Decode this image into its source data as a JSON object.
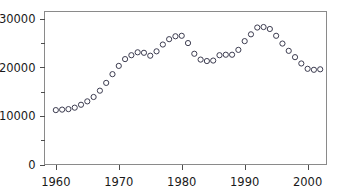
{
  "chart_data": {
    "type": "scatter",
    "title": "",
    "xlabel": "",
    "ylabel": "",
    "xlim": [
      1958.2,
      2003.0
    ],
    "ylim": [
      0,
      31500
    ],
    "grid": false,
    "legend": null,
    "marker": "open-circle",
    "marker_color": "#3c3c50",
    "y_ticks": [
      0,
      10000,
      20000,
      30000
    ],
    "y_tick_labels": [
      "0",
      "10000",
      "20000",
      "30000"
    ],
    "y_minor_ticks": [
      5000,
      15000,
      25000
    ],
    "x_ticks": [
      1960,
      1970,
      1980,
      1990,
      2000
    ],
    "x_tick_labels": [
      "1960",
      "1970",
      "1980",
      "1990",
      "2000"
    ],
    "x": [
      1960,
      1961,
      1962,
      1963,
      1964,
      1965,
      1966,
      1967,
      1968,
      1969,
      1970,
      1971,
      1972,
      1973,
      1974,
      1975,
      1976,
      1977,
      1978,
      1979,
      1980,
      1981,
      1982,
      1983,
      1984,
      1985,
      1986,
      1987,
      1988,
      1989,
      1990,
      1991,
      1992,
      1993,
      1994,
      1995,
      1996,
      1997,
      1998,
      1999,
      2000,
      2001,
      2002
    ],
    "y": [
      11200,
      11300,
      11400,
      11700,
      12300,
      13000,
      13900,
      15200,
      16800,
      18600,
      20300,
      21700,
      22500,
      23100,
      23000,
      22400,
      23300,
      24700,
      25800,
      26400,
      26500,
      25000,
      22800,
      21600,
      21300,
      21400,
      22500,
      22600,
      22600,
      23600,
      25400,
      26800,
      28200,
      28300,
      27900,
      26500,
      24900,
      23400,
      22100,
      20800,
      19700,
      19500,
      19600
    ]
  }
}
